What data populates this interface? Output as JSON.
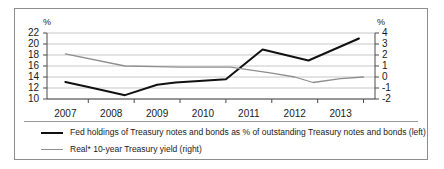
{
  "chart_data": {
    "type": "line",
    "title": "",
    "subtitle": "",
    "xlabel": "",
    "ylabel": "%",
    "ylabel_right": "%",
    "grid": true,
    "legend_position": "bottom-left",
    "x": [
      "2007",
      "2008",
      "2009",
      "2010",
      "2011",
      "2012",
      "2013"
    ],
    "xtick_labels": [
      "2007",
      "2008",
      "2009",
      "2010",
      "2011",
      "2012",
      "2013"
    ],
    "axis_left": {
      "label": "%",
      "ylim": [
        10,
        22
      ],
      "ticks": [
        10,
        12,
        14,
        16,
        18,
        20,
        22
      ],
      "tick_labels": [
        "10",
        "12",
        "14",
        "16",
        "18",
        "20",
        "22"
      ]
    },
    "axis_right": {
      "label": "%",
      "ylim": [
        -2,
        4
      ],
      "ticks": [
        -2,
        -1,
        0,
        1,
        2,
        3,
        4
      ],
      "tick_labels": [
        "-2",
        "-1",
        "0",
        "1",
        "2",
        "3",
        "4"
      ]
    },
    "series": [
      {
        "name": "Fed holdings of Treasury notes and bonds as % of outstanding Treasury notes and bonds (left)",
        "axis": "left",
        "color": "#111111",
        "width": 2,
        "points": [
          {
            "x": 2007.0,
            "y": 13.1
          },
          {
            "x": 2007.5,
            "y": 12.2
          },
          {
            "x": 2008.3,
            "y": 10.7
          },
          {
            "x": 2009.0,
            "y": 12.6
          },
          {
            "x": 2009.4,
            "y": 13.0
          },
          {
            "x": 2010.0,
            "y": 13.3
          },
          {
            "x": 2010.5,
            "y": 13.6
          },
          {
            "x": 2011.3,
            "y": 19.0
          },
          {
            "x": 2012.3,
            "y": 17.0
          },
          {
            "x": 2013.4,
            "y": 21.0
          }
        ]
      },
      {
        "name": "Real* 10-year Treasury yield (right)",
        "axis": "right",
        "color": "#8e8e8e",
        "width": 1.3,
        "points": [
          {
            "x": 2007.0,
            "y": 2.1
          },
          {
            "x": 2008.3,
            "y": 1.0
          },
          {
            "x": 2009.0,
            "y": 0.95
          },
          {
            "x": 2009.5,
            "y": 0.9
          },
          {
            "x": 2010.6,
            "y": 0.9
          },
          {
            "x": 2011.5,
            "y": 0.35
          },
          {
            "x": 2012.0,
            "y": 0.0
          },
          {
            "x": 2012.4,
            "y": -0.5
          },
          {
            "x": 2013.0,
            "y": -0.15
          },
          {
            "x": 2013.5,
            "y": 0.0
          }
        ]
      }
    ]
  },
  "legend": {
    "items": [
      {
        "label": "Fed holdings of Treasury notes and bonds as % of outstanding Treasury notes and bonds (left)",
        "style": "dark"
      },
      {
        "label": "Real* 10-year Treasury yield (right)",
        "style": "gray"
      }
    ]
  },
  "axis_labels": {
    "left_unit": "%",
    "right_unit": "%"
  }
}
